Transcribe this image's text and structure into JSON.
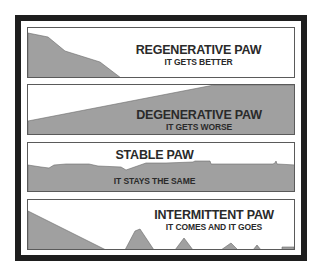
{
  "colors": {
    "frame": "#1e1e1e",
    "panel_border": "#5a5a5a",
    "fill": "#a0a0a0",
    "text": "#2a2a2a",
    "background": "#ffffff"
  },
  "panels": [
    {
      "title": "REGENERATIVE PAW",
      "subtitle": "IT GETS BETTER",
      "trend": "decreasing"
    },
    {
      "title": "DEGENERATIVE PAW",
      "subtitle": "IT GETS WORSE",
      "trend": "increasing"
    },
    {
      "title": "STABLE PAW",
      "subtitle": "IT STAYS THE SAME",
      "trend": "flat"
    },
    {
      "title": "INTERMITTENT PAW",
      "subtitle": "IT COMES AND IT GOES",
      "trend": "episodic"
    }
  ]
}
